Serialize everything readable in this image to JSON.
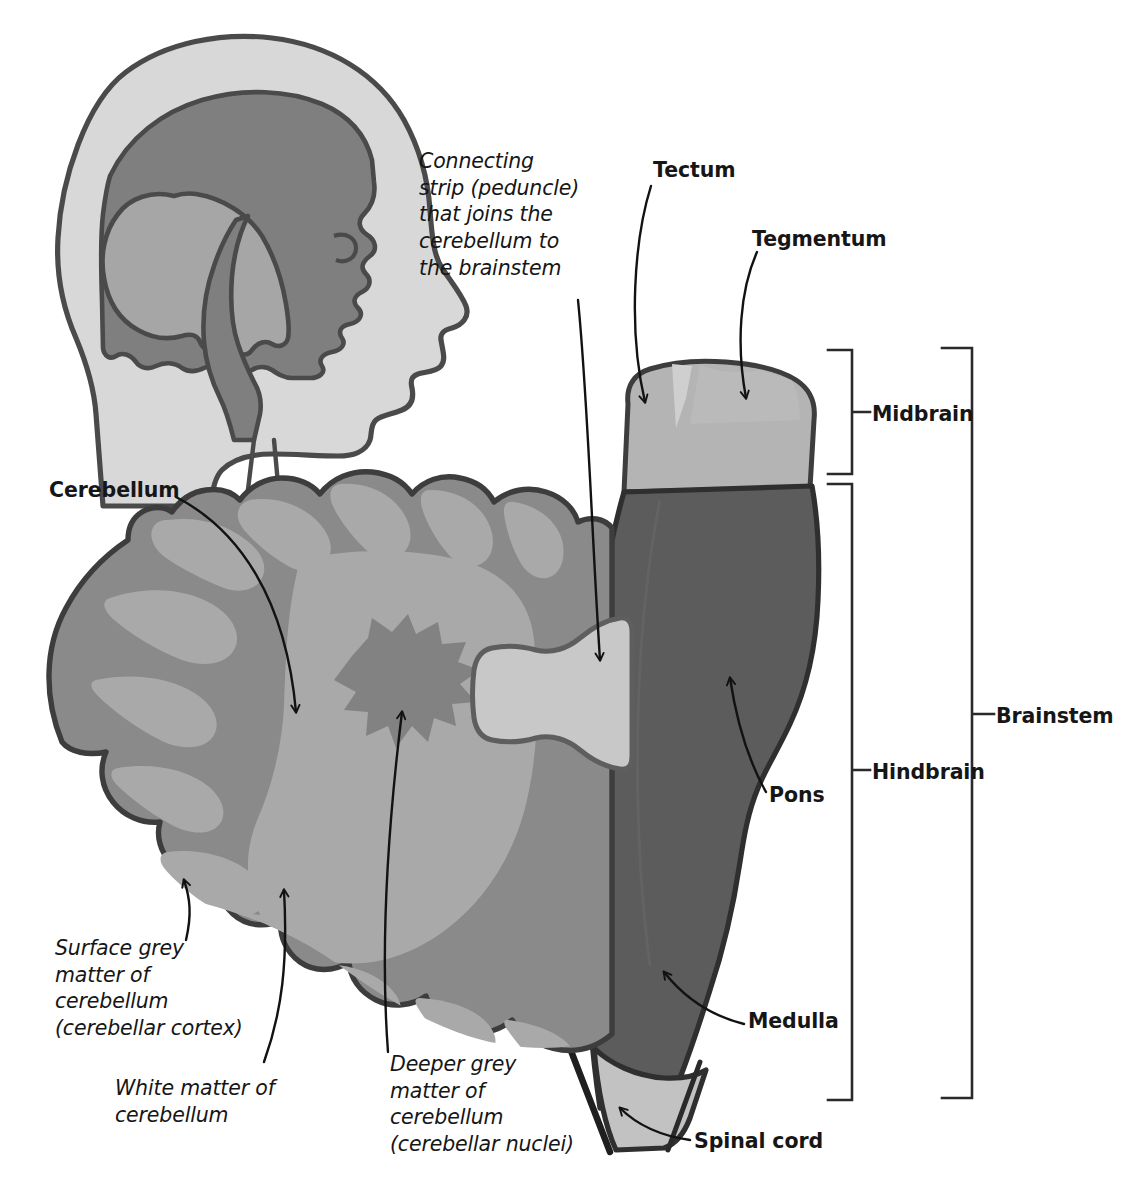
{
  "figure": {
    "labels": {
      "cerebellum": "Cerebellum",
      "tectum": "Tectum",
      "tegmentum": "Tegmentum",
      "midbrain": "Midbrain",
      "hindbrain": "Hindbrain",
      "brainstem": "Brainstem",
      "pons": "Pons",
      "medulla": "Medulla",
      "spinal_cord": "Spinal cord",
      "peduncle": "Connecting\nstrip (peduncle)\nthat joins the\ncerebellum to\nthe brainstem",
      "surface_grey": "Surface grey\nmatter of\ncerebellum\n(cerebellar cortex)",
      "white_matter": "White matter of\ncerebellum",
      "deeper_grey": "Deeper grey\nmatter of\ncerebellum\n(cerebellar nuclei)"
    },
    "colors": {
      "background": "#ffffff",
      "outline": "#3d3d3d",
      "cortex_grey": "#8a8a8a",
      "white_matter_grey": "#a4a4a4",
      "deep_nucleus_grey": "#808080",
      "peduncle_light": "#c8c8c8",
      "midbrain_light": "#b4b4b4",
      "tectum_highlight": "#cfcfcf",
      "brainstem_dark": "#5c5c5c",
      "spinal_cord_light": "#c2c2c2",
      "head_skin": "#d8d8d8",
      "head_cerebrum": "#7f7f7f",
      "head_cerebellum": "#a6a6a6",
      "leader_line": "#1a1a1a",
      "text": "#161616"
    },
    "inset": {
      "name": "head-sagittal-inset",
      "description": "Lateral outline of a human head showing cerebrum, cerebellum, brainstem and spinal cord in situ"
    },
    "structures": [
      {
        "name": "cerebellum",
        "shade": "cortex_grey"
      },
      {
        "name": "cerebellar-white-matter",
        "shade": "white_matter_grey"
      },
      {
        "name": "cerebellar-nuclei",
        "shade": "deep_nucleus_grey"
      },
      {
        "name": "cerebellar-peduncle",
        "shade": "peduncle_light"
      },
      {
        "name": "midbrain",
        "shade": "midbrain_light"
      },
      {
        "name": "pons",
        "shade": "brainstem_dark"
      },
      {
        "name": "medulla",
        "shade": "brainstem_dark"
      },
      {
        "name": "spinal-cord",
        "shade": "spinal_cord_light"
      }
    ]
  }
}
